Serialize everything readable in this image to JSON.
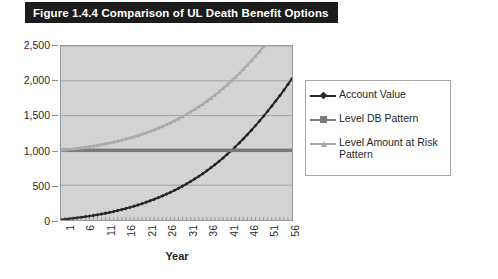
{
  "figure": {
    "title": "Figure 1.4.4 Comparison of UL Death Benefit Options"
  },
  "colors": {
    "title_bar_bg": "#1c1c1c",
    "title_bar_text": "#ffffff",
    "plot_bg": "#d3d3d3",
    "gridline": "#8f8f8f",
    "account_value": "#262626",
    "level_db_pattern": "#7a7a7a",
    "level_amount_at_risk": "#a9a9a9",
    "legend_border": "#a8a8a8",
    "legend_bg": "#ffffff",
    "axis_text": "#2b2b2b"
  },
  "legend": {
    "position": "right",
    "entries": [
      {
        "label": "Account Value",
        "marker": "diamond",
        "color": "#262626"
      },
      {
        "label": "Level DB Pattern",
        "marker": "square",
        "color": "#7a7a7a"
      },
      {
        "label": "Level Amount at Risk Pattern",
        "marker": "triangle",
        "color": "#a9a9a9"
      }
    ]
  },
  "chart_data": {
    "type": "line",
    "title": "Figure 1.4.4 Comparison of UL Death Benefit Options",
    "subtitle": "",
    "xlabel": "Year",
    "ylabel": "",
    "grid": true,
    "legend_position": "right",
    "xlim": [
      1,
      58
    ],
    "ylim": [
      0,
      2500
    ],
    "ytick_labels": [
      "0",
      "500",
      "1,000",
      "1,500",
      "2,000",
      "2,500"
    ],
    "yticks": [
      0,
      500,
      1000,
      1500,
      2000,
      2500
    ],
    "xtick_labels": [
      "1",
      "6",
      "11",
      "16",
      "21",
      "26",
      "31",
      "36",
      "41",
      "46",
      "51",
      "56"
    ],
    "xticks": [
      1,
      6,
      11,
      16,
      21,
      26,
      31,
      36,
      41,
      46,
      51,
      56
    ],
    "x": [
      1,
      2,
      3,
      4,
      5,
      6,
      7,
      8,
      9,
      10,
      11,
      12,
      13,
      14,
      15,
      16,
      17,
      18,
      19,
      20,
      21,
      22,
      23,
      24,
      25,
      26,
      27,
      28,
      29,
      30,
      31,
      32,
      33,
      34,
      35,
      36,
      37,
      38,
      39,
      40,
      41,
      42,
      43,
      44,
      45,
      46,
      47,
      48,
      49,
      50,
      51,
      52,
      53,
      54,
      55,
      56,
      57,
      58
    ],
    "series": [
      {
        "name": "Account Value",
        "marker": "diamond",
        "color": "#262626",
        "values": [
          5,
          11,
          17,
          24,
          31,
          39,
          47,
          56,
          65,
          75,
          86,
          97,
          109,
          122,
          136,
          150,
          165,
          181,
          198,
          216,
          235,
          255,
          276,
          298,
          321,
          345,
          371,
          398,
          426,
          456,
          487,
          520,
          554,
          590,
          628,
          667,
          708,
          751,
          796,
          843,
          892,
          943,
          996,
          1051,
          1108,
          1167,
          1228,
          1291,
          1356,
          1423,
          1492,
          1563,
          1636,
          1711,
          1788,
          1867,
          1948,
          2031
        ]
      },
      {
        "name": "Level DB Pattern",
        "marker": "square",
        "color": "#7a7a7a",
        "values": [
          1000,
          1000,
          1000,
          1000,
          1000,
          1000,
          1000,
          1000,
          1000,
          1000,
          1000,
          1000,
          1000,
          1000,
          1000,
          1000,
          1000,
          1000,
          1000,
          1000,
          1000,
          1000,
          1000,
          1000,
          1000,
          1000,
          1000,
          1000,
          1000,
          1000,
          1000,
          1000,
          1000,
          1000,
          1000,
          1000,
          1000,
          1000,
          1000,
          1000,
          1000,
          1000,
          1000,
          1000,
          1000,
          1000,
          1000,
          1000,
          1000,
          1000,
          1000,
          1000,
          1000,
          1000,
          1000,
          1000,
          1000,
          1000
        ]
      },
      {
        "name": "Level Amount at Risk Pattern",
        "marker": "triangle",
        "color": "#a9a9a9",
        "values": [
          1005,
          1011,
          1017,
          1024,
          1031,
          1039,
          1047,
          1056,
          1065,
          1075,
          1086,
          1097,
          1109,
          1122,
          1136,
          1150,
          1165,
          1181,
          1198,
          1216,
          1235,
          1255,
          1276,
          1298,
          1321,
          1345,
          1371,
          1398,
          1426,
          1456,
          1487,
          1520,
          1554,
          1590,
          1628,
          1667,
          1708,
          1751,
          1796,
          1843,
          1892,
          1943,
          1996,
          2051,
          2108,
          2167,
          2228,
          2291,
          2356,
          2423,
          2492,
          2563,
          2636,
          2711,
          2788,
          2867,
          2948,
          3031
        ]
      }
    ]
  }
}
